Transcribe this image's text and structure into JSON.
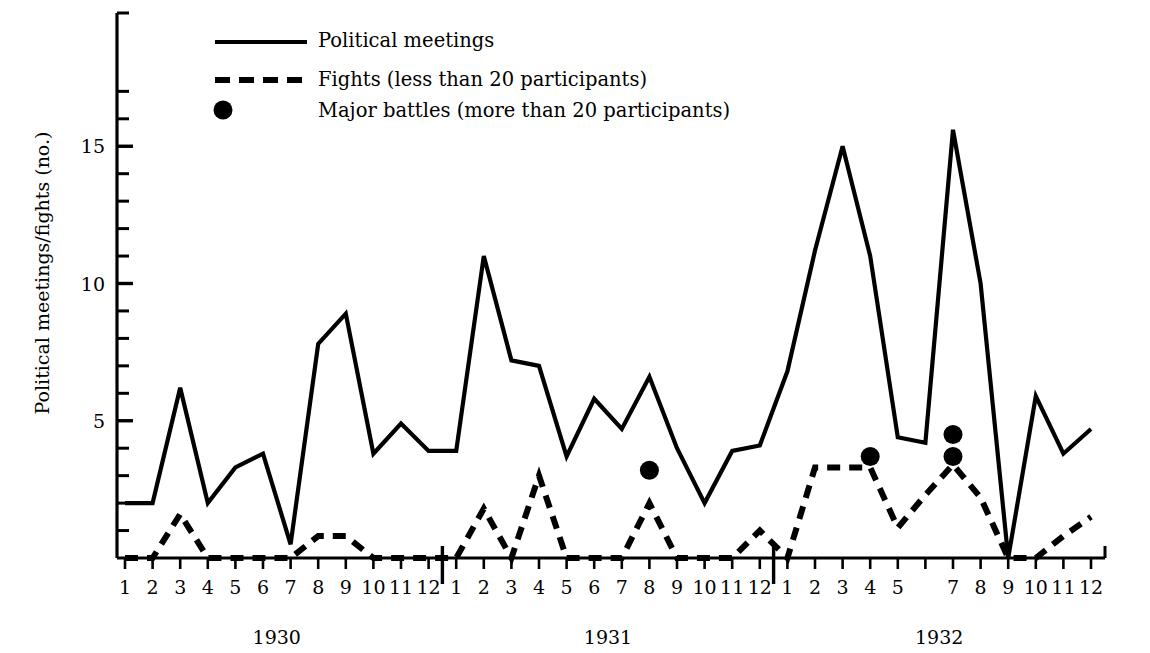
{
  "axes": {
    "ylabel": "Political meetings/fights (no.)",
    "y_tick_labels": [
      {
        "value": 5,
        "label": "5"
      },
      {
        "value": 10,
        "label": "10"
      },
      {
        "value": 15,
        "label": "15"
      }
    ],
    "y_minor_ticks": [
      1,
      2,
      3,
      4,
      6,
      7,
      8,
      9,
      11,
      12,
      13,
      14,
      16,
      17
    ],
    "ylim": [
      0,
      17
    ],
    "grid": false,
    "xlabel": ""
  },
  "legend": {
    "position": "top-left-inside",
    "entries": [
      {
        "marker": "solid-line",
        "label": "Political meetings"
      },
      {
        "marker": "dashed-line",
        "label": "Fights (less than 20 participants)"
      },
      {
        "marker": "filled-circle",
        "label": "Major battles (more than 20 participants)"
      }
    ]
  },
  "x_axis_groups": [
    {
      "year": "1930",
      "months": [
        "1",
        "2",
        "3",
        "4",
        "5",
        "6",
        "7",
        "8",
        "9",
        "10",
        "11",
        "12"
      ]
    },
    {
      "year": "1931",
      "months": [
        "1",
        "2",
        "3",
        "4",
        "5",
        "6",
        "7",
        "8",
        "9",
        "10",
        "11",
        "12"
      ]
    },
    {
      "year": "1932",
      "months": [
        "1",
        "2",
        "3",
        "4",
        "5",
        "",
        "7",
        "8",
        "9",
        "10",
        "11",
        "12"
      ]
    }
  ],
  "colors": {
    "line": "#000000",
    "background": "#ffffff",
    "text": "#000000"
  },
  "chart_data": {
    "type": "line",
    "title": "",
    "xlabel": "",
    "ylabel": "Political meetings/fights (no.)",
    "ylim": [
      0,
      17
    ],
    "grid": false,
    "x": [
      "1930-1",
      "1930-2",
      "1930-3",
      "1930-4",
      "1930-5",
      "1930-6",
      "1930-7",
      "1930-8",
      "1930-9",
      "1930-10",
      "1930-11",
      "1930-12",
      "1931-1",
      "1931-2",
      "1931-3",
      "1931-4",
      "1931-5",
      "1931-6",
      "1931-7",
      "1931-8",
      "1931-9",
      "1931-10",
      "1931-11",
      "1931-12",
      "1932-1",
      "1932-2",
      "1932-3",
      "1932-4",
      "1932-5",
      "1932-6",
      "1932-7",
      "1932-8",
      "1932-9",
      "1932-10",
      "1932-11",
      "1932-12"
    ],
    "series": [
      {
        "name": "Political meetings",
        "style": "solid",
        "values": [
          2.0,
          2.0,
          6.2,
          2.0,
          3.3,
          3.8,
          0.5,
          7.8,
          8.9,
          3.8,
          4.9,
          3.9,
          3.9,
          11.0,
          7.2,
          7.0,
          3.7,
          5.8,
          4.7,
          6.6,
          4.0,
          2.0,
          3.9,
          4.1,
          6.8,
          11.2,
          15.0,
          11.0,
          4.4,
          4.2,
          15.6,
          10.0,
          0.0,
          5.9,
          3.8,
          4.7
        ]
      },
      {
        "name": "Fights (less than 20 participants)",
        "style": "dashed",
        "values": [
          0.0,
          0.0,
          1.6,
          0.0,
          0.0,
          0.0,
          0.0,
          0.8,
          0.8,
          0.0,
          0.0,
          0.0,
          0.0,
          1.8,
          0.0,
          3.0,
          0.0,
          0.0,
          0.0,
          2.0,
          0.0,
          0.0,
          0.0,
          1.0,
          0.0,
          3.3,
          3.3,
          3.3,
          1.1,
          2.3,
          3.4,
          2.2,
          0.0,
          0.0,
          0.8,
          1.5
        ]
      }
    ],
    "point_series": [
      {
        "name": "Major battles (more than 20 participants)",
        "style": "filled-circle",
        "points": [
          {
            "x": "1931-8",
            "y": 3.2
          },
          {
            "x": "1932-4",
            "y": 3.7
          },
          {
            "x": "1932-7",
            "y": 4.5
          },
          {
            "x": "1932-7b",
            "y": 3.7
          }
        ]
      }
    ]
  }
}
